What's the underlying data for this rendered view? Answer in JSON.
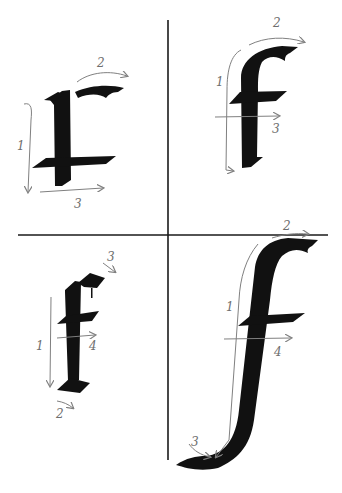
{
  "diagram": {
    "colors": {
      "ink": "#111111",
      "guide": "#808080",
      "grid": "#1a1a1a",
      "background": "#ffffff"
    },
    "panels": [
      {
        "id": "top-left",
        "letter": "r",
        "strokes": [
          {
            "number": "1",
            "direction": "down"
          },
          {
            "number": "2",
            "direction": "right-arc"
          },
          {
            "number": "3",
            "direction": "right"
          }
        ]
      },
      {
        "id": "top-right",
        "letter": "f",
        "strokes": [
          {
            "number": "1",
            "direction": "down"
          },
          {
            "number": "2",
            "direction": "right-arc"
          },
          {
            "number": "3",
            "direction": "right"
          }
        ]
      },
      {
        "id": "bottom-left",
        "letter": "f (blackletter)",
        "strokes": [
          {
            "number": "1",
            "direction": "down"
          },
          {
            "number": "2",
            "direction": "right"
          },
          {
            "number": "3",
            "direction": "down-right"
          },
          {
            "number": "4",
            "direction": "right"
          }
        ]
      },
      {
        "id": "bottom-right",
        "letter": "f (long descender)",
        "strokes": [
          {
            "number": "1",
            "direction": "down"
          },
          {
            "number": "2",
            "direction": "right-arc"
          },
          {
            "number": "3",
            "direction": "down-right-arc"
          },
          {
            "number": "4",
            "direction": "right"
          }
        ]
      }
    ]
  }
}
